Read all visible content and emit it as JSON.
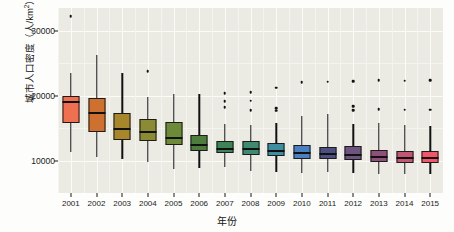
{
  "chart_data": {
    "type": "box",
    "title": "",
    "xlabel": "年份",
    "ylabel_text": "城市人口密度（人/km",
    "ylabel_sup": "2",
    "ylabel_tail": "）",
    "ylabel_full": "城市人口密度（人/km²）",
    "categories": [
      "2001",
      "2002",
      "2003",
      "2004",
      "2005",
      "2006",
      "2007",
      "2008",
      "2009",
      "2010",
      "2011",
      "2012",
      "2013",
      "2014",
      "2015"
    ],
    "ylim": [
      5000,
      33500
    ],
    "yticks": [
      10000,
      20000,
      30000
    ],
    "ytick_labels": [
      "10000",
      "20000",
      "30000"
    ],
    "y_minor_ticks": [
      5000,
      15000,
      25000
    ],
    "grid": true,
    "legend": "none",
    "panel_bg": "#ebebe4",
    "grid_major_color": "#fbfbf8",
    "grid_minor_color": "#f3f3ef",
    "boxes": [
      {
        "year": "2001",
        "color": "#ef7050",
        "lower_whisker": 11250,
        "q1": 15750,
        "median": 19000,
        "q3": 20000,
        "upper_whisker": 23450,
        "outliers": [
          32200
        ]
      },
      {
        "year": "2002",
        "color": "#ce7030",
        "lower_whisker": 10500,
        "q1": 14400,
        "median": 17350,
        "q3": 19600,
        "upper_whisker": 26300,
        "outliers": []
      },
      {
        "year": "2003",
        "color": "#a8862c",
        "lower_whisker": 10200,
        "q1": 13100,
        "median": 14900,
        "q3": 17400,
        "upper_whisker": 23450,
        "outliers": []
      },
      {
        "year": "2004",
        "color": "#8a8b33",
        "lower_whisker": 9800,
        "q1": 13000,
        "median": 14400,
        "q3": 16350,
        "upper_whisker": 19850,
        "outliers": [
          23750
        ]
      },
      {
        "year": "2005",
        "color": "#6d8a38",
        "lower_whisker": 8750,
        "q1": 12350,
        "median": 13500,
        "q3": 16000,
        "upper_whisker": 20200,
        "outliers": []
      },
      {
        "year": "2006",
        "color": "#4c7d3c",
        "lower_whisker": 8900,
        "q1": 11500,
        "median": 12400,
        "q3": 13900,
        "upper_whisker": 20300,
        "outliers": []
      },
      {
        "year": "2007",
        "color": "#3f8357",
        "lower_whisker": 9050,
        "q1": 11150,
        "median": 11850,
        "q3": 13000,
        "upper_whisker": 15600,
        "outliers": [
          18200,
          19100,
          20400
        ]
      },
      {
        "year": "2008",
        "color": "#3f8a70",
        "lower_whisker": 8400,
        "q1": 10900,
        "median": 11750,
        "q3": 13050,
        "upper_whisker": 15500,
        "outliers": [
          17800,
          19250,
          20500
        ]
      },
      {
        "year": "2009",
        "color": "#3f8da0",
        "lower_whisker": 8300,
        "q1": 10700,
        "median": 11500,
        "q3": 12650,
        "upper_whisker": 15750,
        "outliers": [
          17700,
          18100,
          21200
        ]
      },
      {
        "year": "2010",
        "color": "#4a80c0",
        "lower_whisker": 8100,
        "q1": 10250,
        "median": 11100,
        "q3": 12450,
        "upper_whisker": 16850,
        "outliers": [
          22100
        ]
      },
      {
        "year": "2011",
        "color": "#4b5080",
        "lower_whisker": 8200,
        "q1": 10200,
        "median": 11000,
        "q3": 12100,
        "upper_whisker": 17100,
        "outliers": [
          22150
        ]
      },
      {
        "year": "2012",
        "color": "#6e5580",
        "lower_whisker": 8150,
        "q1": 10050,
        "median": 10900,
        "q3": 12200,
        "upper_whisker": 15700,
        "outliers": [
          17800,
          18350,
          22250
        ]
      },
      {
        "year": "2013",
        "color": "#8e4f79",
        "lower_whisker": 8000,
        "q1": 9700,
        "median": 10550,
        "q3": 11700,
        "upper_whisker": 15750,
        "outliers": [
          17900,
          22350
        ]
      },
      {
        "year": "2014",
        "color": "#c05872",
        "lower_whisker": 7950,
        "q1": 9650,
        "median": 10400,
        "q3": 11450,
        "upper_whisker": 15450,
        "outliers": [
          17850,
          22300
        ]
      },
      {
        "year": "2015",
        "color": "#f2566a",
        "lower_whisker": 7900,
        "q1": 9550,
        "median": 10350,
        "q3": 11400,
        "upper_whisker": 15350,
        "outliers": [
          17850,
          22400
        ]
      }
    ]
  }
}
